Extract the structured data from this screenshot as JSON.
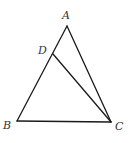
{
  "diagram": {
    "type": "geometry-triangle",
    "points": {
      "A": {
        "label": "A",
        "x": 67,
        "y": 26,
        "lx": 62,
        "ly": 19
      },
      "B": {
        "label": "B",
        "x": 17,
        "y": 121,
        "lx": 3,
        "ly": 129
      },
      "C": {
        "label": "C",
        "x": 111,
        "y": 122,
        "lx": 115,
        "ly": 130
      },
      "D": {
        "label": "D",
        "x": 53,
        "y": 54,
        "lx": 38,
        "ly": 54
      }
    },
    "segments": [
      {
        "name": "AB",
        "from": "A",
        "to": "B"
      },
      {
        "name": "AC",
        "from": "A",
        "to": "C"
      },
      {
        "name": "BC",
        "from": "B",
        "to": "C"
      },
      {
        "name": "DC",
        "from": "D",
        "to": "C"
      }
    ],
    "colors": {
      "stroke": "#1a1a1a",
      "label": "#333333",
      "background": "#ffffff"
    }
  }
}
